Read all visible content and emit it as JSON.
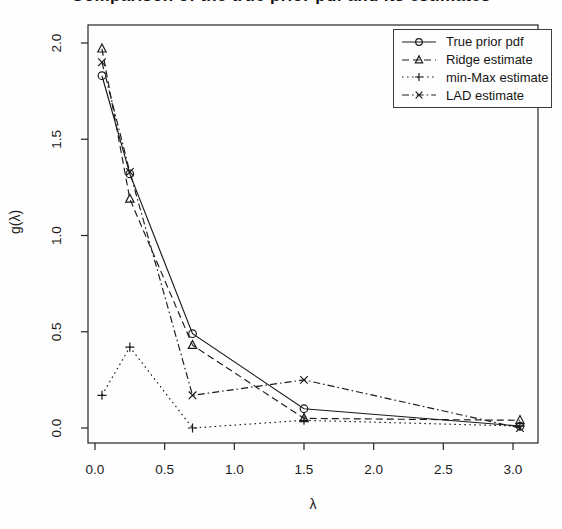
{
  "title": "Comparison of the true prior pdf and its estimates",
  "chart_data": {
    "type": "line",
    "x": [
      0.05,
      0.25,
      0.7,
      1.5,
      3.05
    ],
    "series": [
      {
        "name": "True prior pdf",
        "line": "solid",
        "marker": "circle",
        "values": [
          1.83,
          1.32,
          0.49,
          0.1,
          0.01
        ]
      },
      {
        "name": "Ridge estimate",
        "line": "dashed",
        "marker": "triangle",
        "values": [
          1.97,
          1.19,
          0.43,
          0.05,
          0.04
        ]
      },
      {
        "name": "min-Max estimate",
        "line": "dotted",
        "marker": "plus",
        "values": [
          0.17,
          0.42,
          0.0,
          0.04,
          0.01
        ]
      },
      {
        "name": "LAD estimate",
        "line": "dashdot",
        "marker": "x",
        "values": [
          1.9,
          1.33,
          0.17,
          0.25,
          0.0
        ]
      }
    ],
    "xlabel": "λ",
    "ylabel": "g(λ)",
    "xlim": [
      -0.05,
      3.18
    ],
    "ylim": [
      -0.08,
      2.09
    ],
    "xticks": {
      "values": [
        0.0,
        0.5,
        1.0,
        1.5,
        2.0,
        2.5,
        3.0
      ],
      "labels": [
        "0.0",
        "0.5",
        "1.0",
        "1.5",
        "2.0",
        "2.5",
        "3.0"
      ]
    },
    "yticks": {
      "values": [
        0.0,
        0.5,
        1.0,
        1.5,
        2.0
      ],
      "labels": [
        "0.0",
        "0.5",
        "1.0",
        "1.5",
        "2.0"
      ]
    },
    "legend_position": "top-right",
    "grid": false,
    "color": "#000000",
    "background": "#ffffff"
  }
}
